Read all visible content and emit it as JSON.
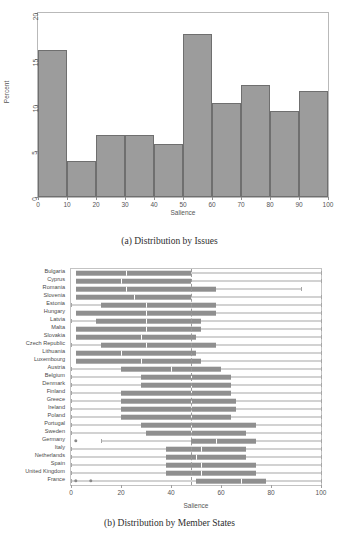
{
  "figure": {
    "panel_a_caption": "(a) Distribution by Issues",
    "panel_b_caption": "(b) Distribution by Member States"
  },
  "chart_data": [
    {
      "type": "bar",
      "title": "",
      "subtitle": "",
      "caption": "(a) Distribution by Issues",
      "xlabel": "Salience",
      "ylabel": "Percent",
      "xlim": [
        0,
        100
      ],
      "ylim": [
        0,
        20
      ],
      "xticks": [
        0,
        10,
        20,
        30,
        40,
        50,
        60,
        70,
        80,
        90,
        100
      ],
      "yticks": [
        0,
        5,
        10,
        15,
        20
      ],
      "grid": false,
      "legend": "none",
      "bin_width": 10,
      "categories": [
        "0-10",
        "10-20",
        "20-30",
        "30-40",
        "40-50",
        "50-60",
        "60-70",
        "70-80",
        "80-90",
        "90-100"
      ],
      "bin_edges": [
        0,
        10,
        20,
        30,
        40,
        50,
        60,
        70,
        80,
        90,
        100
      ],
      "values": [
        16.0,
        3.9,
        6.7,
        6.7,
        5.8,
        17.7,
        10.2,
        12.2,
        9.4,
        11.5
      ],
      "bar_fill": "#9c9c9c",
      "bar_stroke": "#6f6f6f"
    },
    {
      "type": "box",
      "title": "",
      "caption": "(b) Distribution by Member States",
      "xlabel": "Salience",
      "ylabel": "",
      "xlim": [
        0,
        100
      ],
      "xticks": [
        0,
        20,
        40,
        60,
        80,
        100
      ],
      "grid": false,
      "legend": "none",
      "reference_line": 48,
      "box_fill": "#8f8f8f",
      "median_color": "#ffffff",
      "whisker_color": "#a6a6a6",
      "categories": [
        "Bulgaria",
        "Cyprus",
        "Romania",
        "Slovenia",
        "Estonia",
        "Hungary",
        "Latvia",
        "Malta",
        "Slovakia",
        "Czech Republic",
        "Lithuania",
        "Luxembourg",
        "Austria",
        "Belgium",
        "Denmark",
        "Finland",
        "Greece",
        "Ireland",
        "Poland",
        "Portugal",
        "Sweden",
        "Germany",
        "Italy",
        "Netherlands",
        "Spain",
        "United Kingdom",
        "France"
      ],
      "boxes": [
        {
          "name": "Bulgaria",
          "whisker_low": 2,
          "q1": 2,
          "median": 22,
          "q3": 48,
          "whisker_high": 100,
          "outliers": []
        },
        {
          "name": "Cyprus",
          "whisker_low": 2,
          "q1": 2,
          "median": 20,
          "q3": 48,
          "whisker_high": 100,
          "outliers": []
        },
        {
          "name": "Romania",
          "whisker_low": 2,
          "q1": 2,
          "median": 22,
          "q3": 58,
          "whisker_high": 92,
          "outliers": []
        },
        {
          "name": "Slovenia",
          "whisker_low": 2,
          "q1": 2,
          "median": 25,
          "q3": 48,
          "whisker_high": 100,
          "outliers": []
        },
        {
          "name": "Estonia",
          "whisker_low": 0,
          "q1": 12,
          "median": 30,
          "q3": 58,
          "whisker_high": 100,
          "outliers": []
        },
        {
          "name": "Hungary",
          "whisker_low": 2,
          "q1": 2,
          "median": 30,
          "q3": 58,
          "whisker_high": 100,
          "outliers": []
        },
        {
          "name": "Latvia",
          "whisker_low": 0,
          "q1": 10,
          "median": 30,
          "q3": 52,
          "whisker_high": 100,
          "outliers": []
        },
        {
          "name": "Malta",
          "whisker_low": 2,
          "q1": 2,
          "median": 30,
          "q3": 52,
          "whisker_high": 100,
          "outliers": []
        },
        {
          "name": "Slovakia",
          "whisker_low": 2,
          "q1": 2,
          "median": 28,
          "q3": 50,
          "whisker_high": 100,
          "outliers": []
        },
        {
          "name": "Czech Republic",
          "whisker_low": 0,
          "q1": 12,
          "median": 30,
          "q3": 58,
          "whisker_high": 100,
          "outliers": []
        },
        {
          "name": "Lithuania",
          "whisker_low": 2,
          "q1": 2,
          "median": 20,
          "q3": 50,
          "whisker_high": 100,
          "outliers": []
        },
        {
          "name": "Luxembourg",
          "whisker_low": 2,
          "q1": 2,
          "median": 28,
          "q3": 52,
          "whisker_high": 100,
          "outliers": []
        },
        {
          "name": "Austria",
          "whisker_low": 0,
          "q1": 20,
          "median": 40,
          "q3": 60,
          "whisker_high": 100,
          "outliers": []
        },
        {
          "name": "Belgium",
          "whisker_low": 0,
          "q1": 28,
          "median": 48,
          "q3": 64,
          "whisker_high": 100,
          "outliers": []
        },
        {
          "name": "Denmark",
          "whisker_low": 0,
          "q1": 28,
          "median": 48,
          "q3": 64,
          "whisker_high": 100,
          "outliers": []
        },
        {
          "name": "Finland",
          "whisker_low": 0,
          "q1": 20,
          "median": 48,
          "q3": 64,
          "whisker_high": 100,
          "outliers": []
        },
        {
          "name": "Greece",
          "whisker_low": 0,
          "q1": 20,
          "median": 48,
          "q3": 66,
          "whisker_high": 100,
          "outliers": []
        },
        {
          "name": "Ireland",
          "whisker_low": 0,
          "q1": 20,
          "median": 48,
          "q3": 66,
          "whisker_high": 100,
          "outliers": []
        },
        {
          "name": "Poland",
          "whisker_low": 0,
          "q1": 20,
          "median": 48,
          "q3": 64,
          "whisker_high": 100,
          "outliers": []
        },
        {
          "name": "Portugal",
          "whisker_low": 0,
          "q1": 28,
          "median": 48,
          "q3": 74,
          "whisker_high": 100,
          "outliers": []
        },
        {
          "name": "Sweden",
          "whisker_low": 0,
          "q1": 30,
          "median": 48,
          "q3": 70,
          "whisker_high": 100,
          "outliers": []
        },
        {
          "name": "Germany",
          "whisker_low": 12,
          "q1": 48,
          "median": 58,
          "q3": 74,
          "whisker_high": 100,
          "outliers": [
            2
          ]
        },
        {
          "name": "Italy",
          "whisker_low": 0,
          "q1": 38,
          "median": 52,
          "q3": 70,
          "whisker_high": 100,
          "outliers": []
        },
        {
          "name": "Netherlands",
          "whisker_low": 0,
          "q1": 38,
          "median": 50,
          "q3": 70,
          "whisker_high": 100,
          "outliers": []
        },
        {
          "name": "Spain",
          "whisker_low": 0,
          "q1": 38,
          "median": 52,
          "q3": 74,
          "whisker_high": 100,
          "outliers": []
        },
        {
          "name": "United Kingdom",
          "whisker_low": 0,
          "q1": 38,
          "median": 52,
          "q3": 74,
          "whisker_high": 100,
          "outliers": []
        },
        {
          "name": "France",
          "whisker_low": 0,
          "q1": 50,
          "median": 68,
          "q3": 78,
          "whisker_high": 100,
          "outliers": [
            2,
            8
          ]
        }
      ]
    }
  ]
}
